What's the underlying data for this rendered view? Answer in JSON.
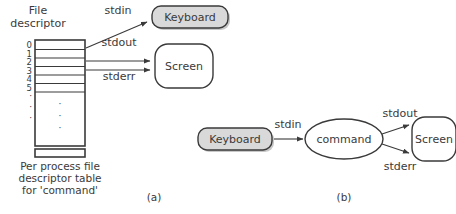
{
  "figure": {
    "title_a": "(a)",
    "title_b": "(b)"
  },
  "panel_a": {
    "heading_line1": "File",
    "heading_line2": "descriptor",
    "fd_table": {
      "rows": [
        "0",
        "1",
        "2",
        "3",
        "4",
        "5"
      ],
      "ellipsis": [
        "·",
        "·",
        "·"
      ],
      "inner_dots": [
        "·",
        "·",
        "·"
      ]
    },
    "caption_line1": "Per process file",
    "caption_line2": "descriptor table",
    "caption_line3": "for 'command'",
    "stream_labels": {
      "stdin": "stdin",
      "stdout": "stdout",
      "stderr": "stderr"
    },
    "nodes": {
      "keyboard": "Keyboard",
      "screen": "Screen"
    }
  },
  "panel_b": {
    "nodes": {
      "keyboard": "Keyboard",
      "command": "command",
      "screen": "Screen"
    },
    "stream_labels": {
      "stdin": "stdin",
      "stdout": "stdout",
      "stderr": "stderr"
    }
  },
  "colors": {
    "stroke": "#3a3a3a",
    "text": "#3a3a3a",
    "fill_gray": "#d9d9d9",
    "fill_white": "#ffffff",
    "shadow": "#9a9a9a",
    "background": "#ffffff"
  }
}
